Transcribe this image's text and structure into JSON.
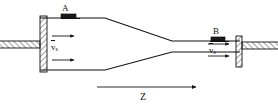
{
  "figure": {
    "type": "cross-section-schematic",
    "labels": {
      "station_a": "A",
      "station_b": "B",
      "axis": "Z",
      "velocity_inlet": "v",
      "velocity_inlet_subscript": "s",
      "velocity_outlet": "v",
      "velocity_outlet_subscript": "s"
    },
    "annotations": {
      "inlet_velocity_full": "v̅s",
      "outlet_velocity_full": "v̅s",
      "axis_direction": "left-to-right",
      "flow_direction": "left-to-right"
    },
    "colors": {
      "line": "#111111",
      "background": "#ffffff",
      "hatch": "#111111",
      "block_fill": "#1a1a1a"
    },
    "geometry": {
      "duct_inlet_top_y": 18,
      "duct_inlet_bottom_y": 70,
      "duct_outlet_top_y": 41,
      "duct_outlet_bottom_y": 52,
      "taper_start_x": 105,
      "taper_end_x": 172,
      "left_wall_x": 40,
      "right_wall_x": 240
    },
    "elements": [
      "left-end-wall-hatched",
      "left-inlet-stub-hatched",
      "right-end-wall-hatched",
      "right-outlet-stub-hatched",
      "sensor-block-a",
      "sensor-block-b",
      "inlet-flow-arrow-upper",
      "inlet-flow-arrow-lower",
      "outlet-flow-arrow-upper",
      "outlet-flow-arrow-lower",
      "z-axis-arrow"
    ]
  }
}
